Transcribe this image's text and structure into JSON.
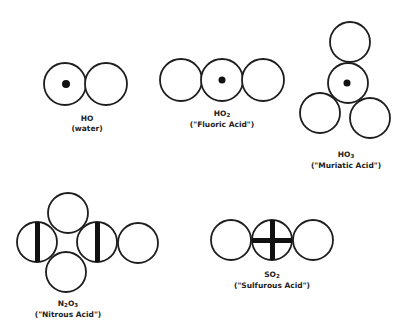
{
  "molecules": [
    {
      "id": "ho",
      "formula": "HO",
      "formula_base": "HO",
      "formula_sub": "",
      "name": "(water)"
    },
    {
      "id": "ho2",
      "formula": "HO2",
      "formula_base": "HO",
      "formula_sub": "2",
      "name": "(\"Fluoric Acid\")"
    },
    {
      "id": "ho3",
      "formula": "HO3",
      "formula_base": "HO",
      "formula_sub": "3",
      "name": "(\"Muriatic Acid\")"
    },
    {
      "id": "n2o3",
      "formula": "N2O3",
      "formula_base_1": "N",
      "formula_sub_1": "2",
      "formula_base_2": "O",
      "formula_sub_2": "3",
      "name": "(\"Nitrous Acid\")"
    },
    {
      "id": "so2",
      "formula": "SO2",
      "formula_base": "SO",
      "formula_sub": "2",
      "name": "(\"Sulfurous Acid\")"
    }
  ],
  "colors": {
    "stroke": "#1e1e1e",
    "fill": "#ffffff",
    "marker": "#111111"
  }
}
